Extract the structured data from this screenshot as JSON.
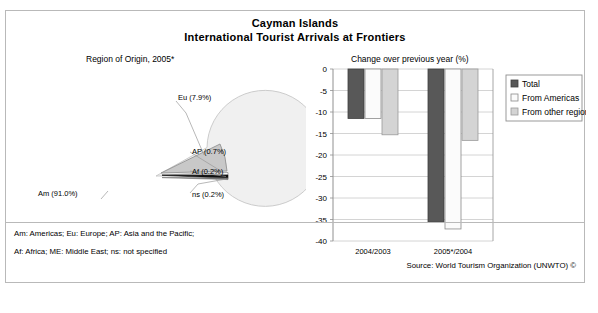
{
  "title": {
    "line1": "Cayman Islands",
    "line2": "International Tourist Arrivals at Frontiers"
  },
  "pie_panel": {
    "subtitle": "Region of Origin, 2005*",
    "labels": {
      "am": "Am (91.0%)",
      "eu": "Eu (7.9%)",
      "ap": "AP (0.7%)",
      "af": "Af (0.2%)",
      "ns": "ns (0.2%)"
    }
  },
  "bar_panel": {
    "subtitle": "Change over previous year (%)"
  },
  "footnotes": {
    "line1": "Am: Americas; Eu: Europe; AP: Asia and the Pacific;",
    "line2": "Af: Africa; ME: Middle East; ns: not specified",
    "source": "Source: World Tourism Organization (UNWTO) ©"
  },
  "colors": {
    "frame": "#b9b9b9",
    "pie_am": "#f0f0f0",
    "pie_eu": "#c8c8c8",
    "pie_ap": "#ffffff",
    "pie_af": "#101010",
    "pie_ns": "#707070",
    "bar_total": "#585858",
    "bar_americas": "#fbfbfb",
    "bar_other": "#d4d4d4",
    "gridline": "#c9c9c9",
    "axis": "#909090"
  },
  "chart_data": [
    {
      "type": "pie",
      "title": "Region of Origin, 2005*",
      "categories": [
        "Am",
        "Eu",
        "AP",
        "Af",
        "ns"
      ],
      "labels": [
        "Am (91.0%)",
        "Eu (7.9%)",
        "AP (0.7%)",
        "Af (0.2%)",
        "ns (0.2%)"
      ],
      "values": [
        91.0,
        7.9,
        0.7,
        0.2,
        0.2
      ],
      "units": "percent",
      "legend": "none",
      "notes": "Eu, AP, Af and ns slices are exploded outward to the right"
    },
    {
      "type": "bar",
      "title": "Change over previous year (%)",
      "xlabel": "",
      "ylabel": "",
      "categories": [
        "2004/2003",
        "2005*/2004"
      ],
      "series": [
        {
          "name": "Total",
          "values": [
            -11.5,
            -35.6
          ]
        },
        {
          "name": "From Americas",
          "values": [
            -11.5,
            -37.2
          ]
        },
        {
          "name": "From other regions",
          "values": [
            -15.3,
            -16.6
          ]
        }
      ],
      "ylim": [
        -40,
        0
      ],
      "yticks": [
        0,
        -5,
        -10,
        -15,
        -20,
        -25,
        -30,
        -35,
        -40
      ],
      "ytick_labels": [
        "0",
        "-5",
        "-10",
        "-15",
        "-20",
        "-25",
        "-30",
        "-35",
        "-40"
      ],
      "grid": true,
      "legend_position": "right",
      "legend": [
        "Total",
        "From Americas",
        "From other regions"
      ]
    }
  ]
}
